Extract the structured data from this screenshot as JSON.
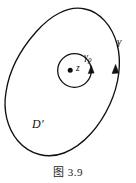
{
  "figure": {
    "caption": "图 3.9",
    "background_color": "#ffffff",
    "stroke_color": "#111111",
    "labels": {
      "outer_curve": "γ",
      "inner_curve": "γ",
      "inner_curve_subscript": "ρ",
      "point": "z",
      "region": "D′"
    },
    "elements": {
      "outer_curve_name": "outer-contour-gamma",
      "inner_curve_name": "inner-circle-gamma-rho",
      "point_name": "point-z",
      "outer_arrow_name": "outer-contour-direction-arrow",
      "inner_arrow_name": "inner-circle-direction-arrow"
    }
  }
}
